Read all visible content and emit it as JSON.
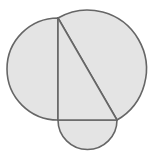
{
  "diagram": {
    "description": "Right triangle with semicircles drawn on each of its three sides",
    "canvas": {
      "width": 154,
      "height": 162,
      "background": "#ffffff"
    },
    "colors": {
      "fill": "#e4e4e4",
      "stroke": "#666666"
    },
    "stroke_width": 1.6,
    "vertices": {
      "A": {
        "x": 58,
        "y": 18
      },
      "B": {
        "x": 58,
        "y": 120
      },
      "C": {
        "x": 117,
        "y": 120
      }
    },
    "semicircles": [
      {
        "side": "AB",
        "center": {
          "x": 58,
          "y": 69
        },
        "radius": 51,
        "direction": "left"
      },
      {
        "side": "BC",
        "center": {
          "x": 87.5,
          "y": 120
        },
        "radius": 29.5,
        "direction": "down"
      },
      {
        "side": "AC",
        "center": {
          "x": 87.5,
          "y": 69
        },
        "radius": 58.5,
        "direction": "up-right"
      }
    ],
    "labels": []
  }
}
